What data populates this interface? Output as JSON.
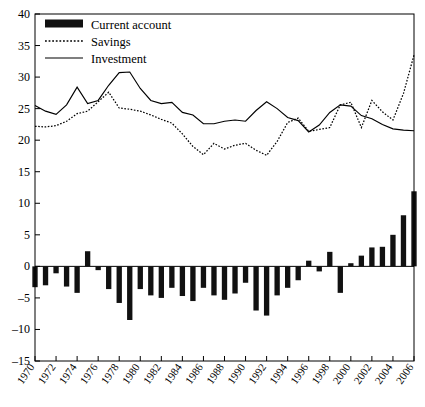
{
  "chart_data": {
    "type": "bar",
    "title": "",
    "subtitle": "",
    "xlabel": "",
    "ylabel": "",
    "ylim": [
      -15,
      40
    ],
    "ytick_step": 5,
    "yticks": [
      -15,
      -10,
      -5,
      0,
      5,
      10,
      15,
      20,
      25,
      30,
      35,
      40
    ],
    "xlim": [
      1970,
      2006
    ],
    "xticks": [
      1970,
      1972,
      1974,
      1976,
      1978,
      1980,
      1982,
      1984,
      1986,
      1988,
      1990,
      1992,
      1994,
      1996,
      1998,
      2000,
      2002,
      2004,
      2006
    ],
    "grid": false,
    "legend_position": "top-left",
    "x": [
      1970,
      1971,
      1972,
      1973,
      1974,
      1975,
      1976,
      1977,
      1978,
      1979,
      1980,
      1981,
      1982,
      1983,
      1984,
      1985,
      1986,
      1987,
      1988,
      1989,
      1990,
      1991,
      1992,
      1993,
      1994,
      1995,
      1996,
      1997,
      1998,
      1999,
      2000,
      2001,
      2002,
      2003,
      2004,
      2005,
      2006
    ],
    "series": [
      {
        "name": "Current account",
        "type": "bar",
        "color": "#111111",
        "values": [
          -3.3,
          -3.0,
          -1.1,
          -3.2,
          -4.2,
          2.4,
          -0.6,
          -3.6,
          -5.8,
          -8.5,
          -3.6,
          -4.6,
          -5.0,
          -3.4,
          -4.7,
          -5.5,
          -3.4,
          -4.6,
          -5.3,
          -4.3,
          -2.6,
          -7.0,
          -7.8,
          -4.6,
          -3.4,
          -2.2,
          0.9,
          -0.8,
          2.3,
          -4.2,
          0.5,
          1.7,
          3.0,
          3.1,
          5.0,
          8.1,
          11.9
        ]
      },
      {
        "name": "Savings",
        "type": "line",
        "style": "dotted",
        "color": "#000000",
        "values": [
          22.2,
          22.1,
          22.3,
          23.0,
          24.2,
          24.6,
          26.1,
          27.6,
          25.1,
          24.9,
          24.6,
          24.0,
          23.3,
          22.7,
          21.0,
          19.0,
          17.7,
          19.5,
          18.6,
          19.2,
          19.5,
          18.4,
          17.6,
          19.8,
          22.8,
          23.5,
          21.4,
          21.7,
          22.0,
          25.6,
          26.0,
          22.0,
          26.3,
          24.5,
          23.2,
          27.4,
          33.5
        ]
      },
      {
        "name": "Investment",
        "type": "line",
        "style": "solid",
        "color": "#000000",
        "values": [
          25.5,
          24.6,
          24.1,
          25.6,
          28.4,
          25.8,
          26.3,
          28.7,
          30.7,
          30.8,
          28.2,
          26.3,
          25.8,
          26.0,
          24.4,
          24.0,
          22.6,
          22.6,
          23.0,
          23.2,
          23.0,
          24.7,
          26.1,
          25.0,
          23.6,
          23.1,
          21.3,
          22.4,
          24.4,
          25.6,
          25.4,
          23.9,
          23.4,
          22.5,
          21.8,
          21.6,
          21.5
        ]
      }
    ]
  },
  "legend": {
    "items": [
      {
        "label": "Current account",
        "marker": "thick-bar"
      },
      {
        "label": "Savings",
        "marker": "dotted-line"
      },
      {
        "label": "Investment",
        "marker": "solid-line"
      }
    ]
  }
}
